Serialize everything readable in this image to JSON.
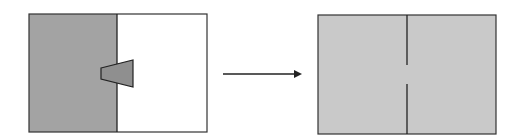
{
  "diagram": {
    "colors": {
      "dark_fill": "#a3a3a3",
      "light_fill": "#c9c9c9",
      "white_fill": "#ffffff",
      "stroke": "#333333"
    },
    "before_box": {
      "x": 29,
      "y": 14,
      "w": 178,
      "h": 118,
      "divider_x": 117
    },
    "after_box": {
      "x": 318,
      "y": 15,
      "w": 178,
      "h": 119,
      "divider_x": 407,
      "gap_top": 65,
      "gap_bottom": 84
    },
    "arrow": {
      "x1": 223,
      "x2": 302,
      "y": 74
    }
  }
}
